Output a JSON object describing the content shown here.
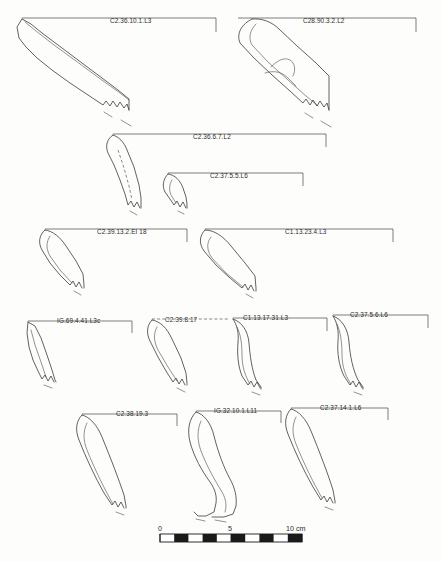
{
  "figure": {
    "type": "archaeological-pottery-profile-plate",
    "caption": "",
    "background_color": "#fdfdfc",
    "ink_color": "#3a3a3a"
  },
  "scale_bar": {
    "name": "scale-bar",
    "unit": "cm",
    "ticks": [
      "0",
      "5",
      "10 cm"
    ],
    "total_cm": 10,
    "segments": 10,
    "x": 160,
    "y": 534,
    "width": 142,
    "height": 8
  },
  "vessels": [
    {
      "id": "v1",
      "label": "C2.36.10.1.L3",
      "row": 1,
      "label_x": 110,
      "label_y": 22,
      "lead_path": "M 22 18 L 216 18 L 216 32"
    },
    {
      "id": "v2",
      "label": "C28.90.3.2.L2",
      "row": 1,
      "label_x": 303,
      "label_y": 22,
      "lead_path": "M 238 18 L 416 18 L 416 32"
    },
    {
      "id": "v3",
      "label": "C2.36.6.7.L2",
      "row": 2,
      "label_x": 193,
      "label_y": 138,
      "lead_path": "M 113 134 L 326 134 L 326 147"
    },
    {
      "id": "v4",
      "label": "C2.37.5.5.L6",
      "row": 2,
      "label_x": 210,
      "label_y": 177,
      "lead_path": "M 168 173 L 303 173 L 303 186"
    },
    {
      "id": "v5",
      "label": "C2.39.13.2.EI 18",
      "row": 3,
      "label_x": 97,
      "label_y": 233,
      "lead_path": "M 45 229 L 187 229 L 187 242"
    },
    {
      "id": "v6",
      "label": "C1.13.23.4.L3",
      "row": 3,
      "label_x": 285,
      "label_y": 233,
      "lead_path": "M 205 229 L 393 229 L 393 242"
    },
    {
      "id": "v7",
      "label": "IG.69.4.41.L3c",
      "row": 4,
      "label_x": 57,
      "label_y": 325,
      "lead_path": "M 28 321 L 132 321 L 132 333"
    },
    {
      "id": "v8",
      "label": "C2.39.8.17",
      "row": 4,
      "label_x": 165,
      "label_y": 325,
      "lead_dashed": true,
      "lead_path": "M 152 319 L 228 319"
    },
    {
      "id": "v9",
      "label": "C1.13.17.31.L3",
      "row": 4,
      "label_x": 243,
      "label_y": 322,
      "lead_path": "M 233 318 L 327 318 L 327 331"
    },
    {
      "id": "v10",
      "label": "C2.37.5.6.L6",
      "row": 4,
      "label_x": 350,
      "label_y": 319,
      "lead_path": "M 333 315 L 428 315 L 428 328"
    },
    {
      "id": "v11",
      "label": "C2.38.19.3",
      "row": 5,
      "label_x": 116,
      "label_y": 418,
      "lead_path": "M 82 414 L 177 414 L 177 426"
    },
    {
      "id": "v12",
      "label": "IG.32.10.1.L11",
      "row": 5,
      "label_x": 214,
      "label_y": 415,
      "lead_path": "M 196 411 L 281 411 L 281 423"
    },
    {
      "id": "v13",
      "label": "C2.37.14.1.L6",
      "row": 5,
      "label_x": 320,
      "label_y": 412,
      "lead_path": "M 291 408 L 388 408 L 388 420"
    }
  ]
}
